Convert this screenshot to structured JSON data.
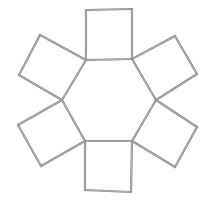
{
  "diagram": {
    "title": "",
    "stroke_color": "#8a8a8a",
    "stroke_highlight": "#c4c4c4",
    "stroke_width": 2.2,
    "hexagon": {
      "vertices": [
        [
          86,
          60
        ],
        [
          132,
          59
        ],
        [
          156,
          100
        ],
        [
          132,
          141
        ],
        [
          85,
          141
        ],
        [
          62,
          100
        ]
      ]
    },
    "squares": [
      {
        "name": "top",
        "points": [
          [
            86,
            60
          ],
          [
            86,
            10
          ],
          [
            132,
            9
          ],
          [
            132,
            59
          ]
        ]
      },
      {
        "name": "upper-right",
        "points": [
          [
            132,
            59
          ],
          [
            175,
            36
          ],
          [
            197,
            74
          ],
          [
            156,
            100
          ]
        ]
      },
      {
        "name": "lower-right",
        "points": [
          [
            156,
            100
          ],
          [
            197,
            127
          ],
          [
            175,
            167
          ],
          [
            132,
            141
          ]
        ]
      },
      {
        "name": "bottom",
        "points": [
          [
            132,
            141
          ],
          [
            131,
            192
          ],
          [
            85,
            190
          ],
          [
            85,
            141
          ]
        ]
      },
      {
        "name": "lower-left",
        "points": [
          [
            85,
            141
          ],
          [
            41,
            166
          ],
          [
            18,
            125
          ],
          [
            62,
            100
          ]
        ]
      },
      {
        "name": "upper-left",
        "points": [
          [
            62,
            100
          ],
          [
            19,
            75
          ],
          [
            40,
            35
          ],
          [
            86,
            60
          ]
        ]
      }
    ]
  }
}
